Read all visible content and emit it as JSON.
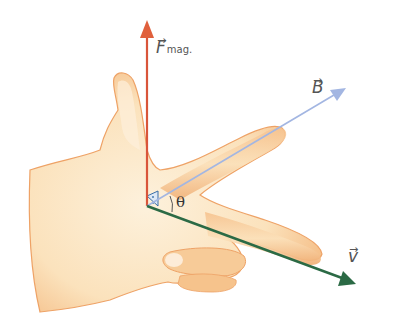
{
  "diagram": {
    "origin": {
      "x": 147,
      "y": 206
    },
    "vectors": [
      {
        "id": "force",
        "symbol": "F",
        "subscript": "mag.",
        "arrow": "→",
        "color": "#d9553a",
        "tip": {
          "x": 147,
          "y": 20
        }
      },
      {
        "id": "field",
        "symbol": "B",
        "subscript": "",
        "arrow": "→",
        "color": "#a3b6e2",
        "tip": {
          "x": 346,
          "y": 88
        }
      },
      {
        "id": "velocity",
        "symbol": "v",
        "subscript": "",
        "arrow": "→",
        "color": "#2b6a45",
        "tip": {
          "x": 356,
          "y": 284
        }
      }
    ],
    "angle": {
      "symbol": "θ",
      "between": [
        "velocity",
        "field"
      ]
    },
    "right_angle_marker": true,
    "hand": {
      "skin_fill": "#fbe3bf",
      "skin_shade": "#f2b77d",
      "outline": "#e59a5a"
    }
  }
}
